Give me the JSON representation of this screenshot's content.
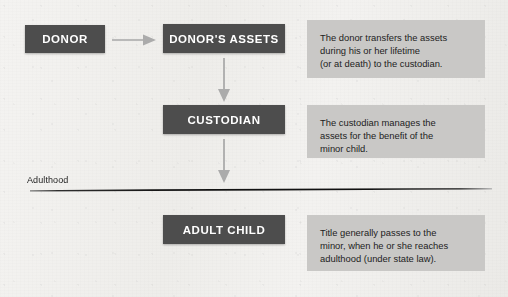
{
  "diagram": {
    "background_color": "#f1f0ee",
    "node_color": "#4d4d4d",
    "panel_color": "#c9c8c6",
    "arrow_color": "#a8a8a8",
    "divider_color": "#1a1a1a"
  },
  "nodes": {
    "donor": "DONOR",
    "donors_assets": "DONOR'S ASSETS",
    "custodian": "CUSTODIAN",
    "adult_child": "ADULT CHILD"
  },
  "descriptions": {
    "transfer": "The donor transfers the assets\nduring his or her lifetime\n(or at death) to the custodian.",
    "manage": "The custodian manages the\nassets for the benefit of the\nminor child.",
    "title_passes": "Title generally passes to the\nminor, when he or she reaches\nadulthood (under state law)."
  },
  "divider": {
    "label": "Adulthood"
  },
  "arrows": {
    "donor_to_assets": "arrow-right-icon",
    "assets_to_custodian": "arrow-down-icon",
    "custodian_to_adult_child": "arrow-down-icon"
  }
}
